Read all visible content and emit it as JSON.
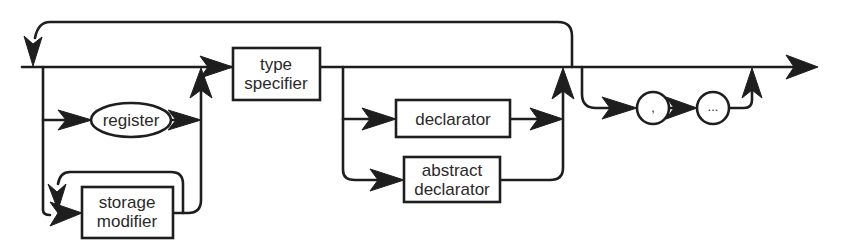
{
  "diagram": {
    "type": "syntax-railroad-diagram",
    "colors": {
      "stroke": "#1e1e1e",
      "background": "#ffffff",
      "text": "#2a2a2a"
    },
    "nodes": {
      "register": {
        "label": "register",
        "shape": "ellipse"
      },
      "storage_modifier": {
        "line1": "storage",
        "line2": "modifier",
        "shape": "rectangle"
      },
      "type_specifier": {
        "line1": "type",
        "line2": "specifier",
        "shape": "rectangle"
      },
      "declarator": {
        "label": "declarator",
        "shape": "rectangle"
      },
      "abstract_declarator": {
        "line1": "abstract",
        "line2": "declarator",
        "shape": "rectangle"
      },
      "comma": {
        "label": ",",
        "shape": "circle"
      },
      "ellipsis": {
        "label": "...",
        "shape": "circle"
      }
    },
    "paths": [
      "entry -> type specifier (main line)",
      "entry -> register -> type specifier",
      "entry -> storage modifier (repeatable loop) -> type specifier",
      "type specifier -> exit (main line)",
      "type specifier -> declarator -> join",
      "type specifier -> abstract declarator -> join",
      "join -> loop back to entry",
      "join -> , -> ... -> exit",
      "join -> exit"
    ]
  }
}
